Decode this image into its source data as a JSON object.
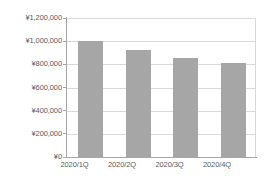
{
  "chart_data": {
    "type": "bar",
    "title": "",
    "xlabel": "",
    "ylabel": "",
    "categories": [
      "2020/1Q",
      "2020/2Q",
      "2020/3Q",
      "2020/4Q"
    ],
    "values": [
      1000000,
      920000,
      855000,
      815000
    ],
    "ylim": [
      0,
      1200000
    ],
    "ytick_values": [
      0,
      200000,
      400000,
      600000,
      800000,
      1000000,
      1200000
    ],
    "ytick_labels": [
      "¥0",
      "¥200,000",
      "¥400,000",
      "¥600,000",
      "¥800,000",
      "¥1,000,000",
      "¥1,200,000"
    ],
    "grid": true,
    "legend": false,
    "currency_symbol": "¥",
    "series": [
      {
        "name": "",
        "values": [
          1000000,
          920000,
          855000,
          815000
        ]
      }
    ],
    "colors": {
      "bar_fill": "#a6a6a6",
      "gridline": "#d9d9d9",
      "axis_line": "#a6a6a6",
      "tick_text": "#5a5a5a",
      "background": "#ffffff"
    }
  }
}
